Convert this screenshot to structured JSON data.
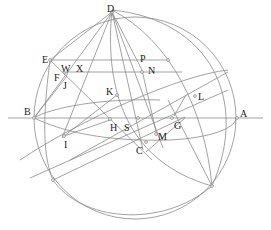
{
  "diagram": {
    "type": "spherical-geometry-construction",
    "colors": {
      "line": "#8a8a8a",
      "label": "#222222",
      "background": "#ffffff"
    },
    "labels": {
      "D": "D",
      "E": "E",
      "W": "W",
      "X": "X",
      "F": "F",
      "J": "J",
      "P": "P",
      "N": "N",
      "K": "K",
      "L": "L",
      "B": "B",
      "A": "A",
      "H": "H",
      "S": "S",
      "G": "G",
      "M": "M",
      "C": "C",
      "I": "I"
    }
  }
}
